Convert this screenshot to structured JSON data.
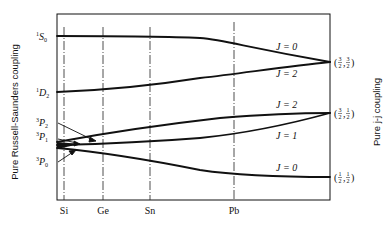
{
  "diagram": {
    "left_axis_label": "Pure Russell-Saunders coupling",
    "right_axis_label": "Pure j-j coupling",
    "elements": [
      "Si",
      "Ge",
      "Sn",
      "Pb"
    ],
    "left_terms": [
      {
        "sup": "1",
        "letter": "S",
        "sub": "0"
      },
      {
        "sup": "1",
        "letter": "D",
        "sub": "2"
      },
      {
        "sup": "3",
        "letter": "P",
        "sub": "2"
      },
      {
        "sup": "3",
        "letter": "P",
        "sub": "1"
      },
      {
        "sup": "3",
        "letter": "P",
        "sub": "0"
      }
    ],
    "right_states": [
      {
        "label": "(3/2, 3/2)",
        "a_num": "3",
        "a_den": "2",
        "b_num": "3",
        "b_den": "2"
      },
      {
        "label": "(3/2, 1/2)",
        "a_num": "3",
        "a_den": "2",
        "b_num": "1",
        "b_den": "2"
      },
      {
        "label": "(1/2, 1/2)",
        "a_num": "1",
        "a_den": "2",
        "b_num": "1",
        "b_den": "2"
      }
    ],
    "j_labels": [
      "J = 0",
      "J = 2",
      "J = 2",
      "J = 1",
      "J = 0"
    ],
    "curves": [
      {
        "name": "1S0 to (3/2,3/2) J=0",
        "from": "1S0",
        "to": "(3/2,3/2)",
        "J": 0
      },
      {
        "name": "1D2 to (3/2,3/2) J=2",
        "from": "1D2",
        "to": "(3/2,3/2)",
        "J": 2
      },
      {
        "name": "3P2 to (3/2,1/2) J=2",
        "from": "3P2",
        "to": "(3/2,1/2)",
        "J": 2
      },
      {
        "name": "3P1 to (3/2,1/2) J=1",
        "from": "3P1",
        "to": "(3/2,1/2)",
        "J": 1
      },
      {
        "name": "3P0 to (1/2,1/2) J=0",
        "from": "3P0",
        "to": "(1/2,1/2)",
        "J": 0
      }
    ]
  }
}
